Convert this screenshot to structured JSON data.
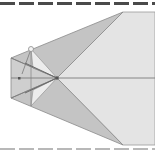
{
  "diagram": {
    "type": "geometric-fold-diagram",
    "colors": {
      "background": "#ffffff",
      "light_face": "#e4e4e4",
      "dark_face": "#c2c2c2",
      "mid_face": "#d0d0d0",
      "edge": "#8a8a8a",
      "top_dash": "#4a4a4a",
      "bottom_dash": "#b8b8b8"
    },
    "points": {
      "center": [
        57,
        78
      ],
      "top_right": [
        123,
        12
      ],
      "bottom_right": [
        123,
        145
      ],
      "left_top": [
        11,
        58
      ],
      "left_bottom": [
        11,
        98
      ],
      "circle": [
        31,
        49
      ],
      "dot": [
        19,
        78
      ]
    }
  }
}
